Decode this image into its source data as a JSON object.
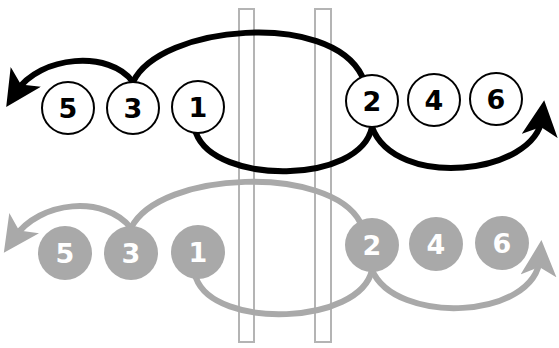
{
  "diagram": {
    "colors": {
      "primary": "#000000",
      "secondary": "#a9a9a9",
      "bar_stroke": "#b4b4b4",
      "secondary_text": "#ffffff"
    },
    "top_row": {
      "style": "outlined",
      "nodes": [
        {
          "label": "5",
          "cx": 68,
          "cy": 108
        },
        {
          "label": "3",
          "cx": 133,
          "cy": 108
        },
        {
          "label": "1",
          "cx": 198,
          "cy": 107
        },
        {
          "label": "2",
          "cx": 372,
          "cy": 101
        },
        {
          "label": "4",
          "cx": 434,
          "cy": 100
        },
        {
          "label": "6",
          "cx": 496,
          "cy": 99
        }
      ]
    },
    "bottom_row": {
      "style": "filled",
      "nodes": [
        {
          "label": "5",
          "cx": 65,
          "cy": 253
        },
        {
          "label": "3",
          "cx": 131,
          "cy": 253
        },
        {
          "label": "1",
          "cx": 198,
          "cy": 252
        },
        {
          "label": "2",
          "cx": 372,
          "cy": 245
        },
        {
          "label": "4",
          "cx": 436,
          "cy": 244
        },
        {
          "label": "6",
          "cx": 502,
          "cy": 243
        }
      ]
    },
    "vertical_bars": [
      {
        "x": 239,
        "y": 9,
        "width": 15,
        "height": 333
      },
      {
        "x": 315,
        "y": 9,
        "width": 16,
        "height": 333
      }
    ]
  }
}
